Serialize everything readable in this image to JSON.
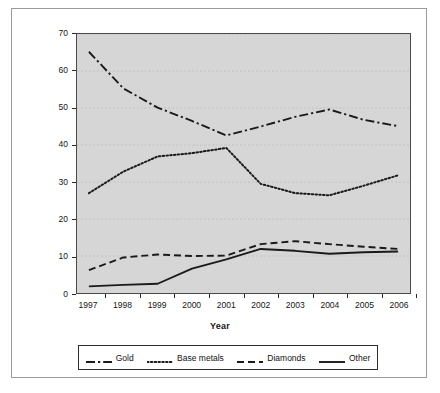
{
  "chart_data": {
    "type": "line",
    "title": "",
    "xlabel": "Year",
    "ylabel": "Percentage",
    "categories": [
      "1997",
      "1998",
      "1999",
      "2000",
      "2001",
      "2002",
      "2003",
      "2004",
      "2005",
      "2006"
    ],
    "x": [
      1997,
      1998,
      1999,
      2000,
      2001,
      2002,
      2003,
      2004,
      2005,
      2006
    ],
    "ylim": [
      0,
      70
    ],
    "yticks": [
      0,
      10,
      20,
      30,
      40,
      50,
      60,
      70
    ],
    "grid": true,
    "grid_axis": "y",
    "legend_position": "bottom",
    "plot_background": "#d6d6d6",
    "figure_background": "#ffffff",
    "line_color": "#1a1a1a",
    "series": [
      {
        "name": "Gold",
        "style": "dash-dot",
        "values": [
          65.2,
          55.3,
          50.1,
          46.5,
          42.6,
          45.0,
          47.6,
          49.6,
          46.8,
          45.1
        ]
      },
      {
        "name": "Base metals",
        "style": "dotted",
        "values": [
          27.0,
          32.8,
          36.9,
          37.8,
          39.2,
          29.5,
          27.0,
          26.4,
          29.0,
          31.8
        ]
      },
      {
        "name": "Diamonds",
        "style": "dashed",
        "values": [
          6.2,
          9.6,
          10.4,
          10.0,
          10.1,
          13.2,
          14.0,
          13.2,
          12.5,
          11.9
        ]
      },
      {
        "name": "Other",
        "style": "solid",
        "values": [
          1.8,
          2.2,
          2.5,
          6.6,
          9.1,
          11.9,
          11.4,
          10.6,
          11.0,
          11.2
        ]
      }
    ]
  },
  "legend": {
    "items": [
      {
        "label": "Gold",
        "swatch": "dash-dot-swatch-icon"
      },
      {
        "label": "Base metals",
        "swatch": "dotted-swatch-icon"
      },
      {
        "label": "Diamonds",
        "swatch": "dashed-swatch-icon"
      },
      {
        "label": "Other",
        "swatch": "solid-swatch-icon"
      }
    ]
  },
  "axes": {
    "y_title": "Percentage",
    "x_title": "Year",
    "y_ticks": [
      "0",
      "10",
      "20",
      "30",
      "40",
      "50",
      "60",
      "70"
    ],
    "x_ticks": [
      "1997",
      "1998",
      "1999",
      "2000",
      "2001",
      "2002",
      "2003",
      "2004",
      "2005",
      "2006"
    ]
  }
}
